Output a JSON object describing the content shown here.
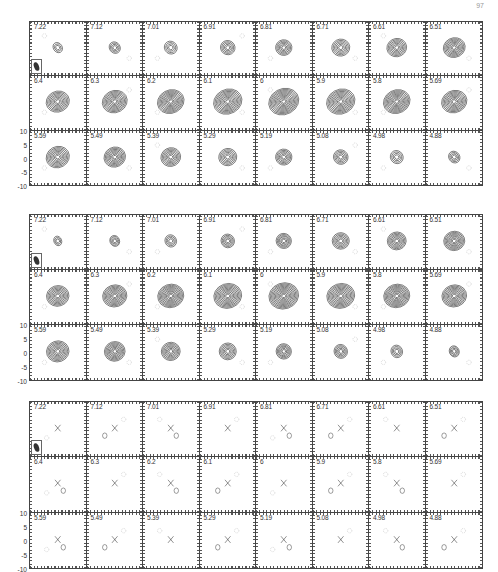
{
  "page_number": "97",
  "figure": {
    "velocity_labels": [
      "7.22",
      "7.12",
      "7.01",
      "6.91",
      "6.81",
      "6.71",
      "6.61",
      "6.51",
      "6.4",
      "6.3",
      "6.2",
      "6.1",
      "6",
      "5.9",
      "5.8",
      "5.69",
      "5.59",
      "5.49",
      "5.39",
      "5.29",
      "5.19",
      "5.08",
      "4.98",
      "4.88"
    ],
    "y_axis_ticks": [
      "10",
      "5",
      "0",
      "-5",
      "-10"
    ],
    "blocks": [
      {
        "name": "observed",
        "top": 21,
        "height": 165,
        "beam": true,
        "style": "dense-contours"
      },
      {
        "name": "model",
        "top": 214,
        "height": 167,
        "beam": true,
        "style": "smooth-contours"
      },
      {
        "name": "residual",
        "top": 401,
        "height": 168,
        "beam": true,
        "style": "sparse-contours-with-cross"
      }
    ]
  },
  "chart_data": {
    "type": "contour-channel-maps",
    "title": "",
    "panel_labels": [
      "7.22",
      "7.12",
      "7.01",
      "6.91",
      "6.81",
      "6.71",
      "6.61",
      "6.51",
      "6.4",
      "6.3",
      "6.2",
      "6.1",
      "6",
      "5.9",
      "5.8",
      "5.69",
      "5.59",
      "5.49",
      "5.39",
      "5.29",
      "5.19",
      "5.08",
      "4.98",
      "4.88"
    ],
    "ylabel_ticks": [
      10,
      5,
      0,
      -5,
      -10
    ],
    "ylim": [
      -10,
      10
    ],
    "xlim": [
      -10,
      10
    ],
    "series": [
      {
        "name": "data",
        "panels": 24
      },
      {
        "name": "model",
        "panels": 24
      },
      {
        "name": "residual",
        "panels": 24
      }
    ]
  }
}
